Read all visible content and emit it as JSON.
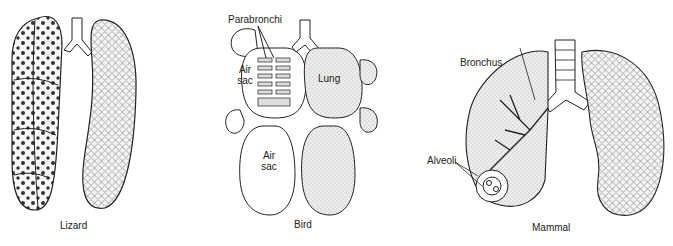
{
  "figures": [
    {
      "id": "lizard",
      "caption": "Lizard",
      "labels": []
    },
    {
      "id": "bird",
      "caption": "Bird",
      "labels": [
        "Parabronchi",
        "Air sac",
        "Lung",
        "Air sac"
      ]
    },
    {
      "id": "mammal",
      "caption": "Mammal",
      "labels": [
        "Bronchus",
        "Alveoli"
      ]
    }
  ],
  "bird": {
    "parabronchi": "Parabronchi",
    "air_sac_upper_1": "Air",
    "air_sac_upper_2": "sac",
    "lung": "Lung",
    "air_sac_lower_1": "Air",
    "air_sac_lower_2": "sac",
    "caption": "Bird"
  },
  "lizard": {
    "caption": "Lizard"
  },
  "mammal": {
    "bronchus": "Bronchus",
    "alveoli": "Alveoli",
    "caption": "Mammal"
  }
}
